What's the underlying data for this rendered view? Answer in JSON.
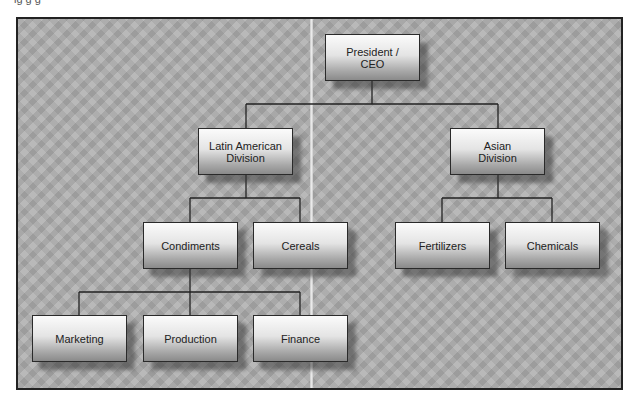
{
  "caption_fragment": "ig g g",
  "colors": {
    "background": "#ababab",
    "frame_border": "#222222",
    "line": "#222222",
    "node_top": "#fbfbfb",
    "node_bottom": "#8a8a8a",
    "text": "#222222"
  },
  "org_chart": {
    "root": {
      "label": "President /\nCEO",
      "children": [
        {
          "label": "Latin American\nDivision",
          "children": [
            {
              "label": "Condiments",
              "children": [
                {
                  "label": "Marketing"
                },
                {
                  "label": "Production"
                },
                {
                  "label": "Finance"
                }
              ]
            },
            {
              "label": "Cereals"
            }
          ]
        },
        {
          "label": "Asian\nDivision",
          "children": [
            {
              "label": "Fertilizers"
            },
            {
              "label": "Chemicals"
            }
          ]
        }
      ]
    }
  },
  "nodes": {
    "ceo": "President /\nCEO",
    "latin_american_division": "Latin American\nDivision",
    "asian_division": "Asian\nDivision",
    "condiments": "Condiments",
    "cereals": "Cereals",
    "fertilizers": "Fertilizers",
    "chemicals": "Chemicals",
    "marketing": "Marketing",
    "production": "Production",
    "finance": "Finance"
  }
}
